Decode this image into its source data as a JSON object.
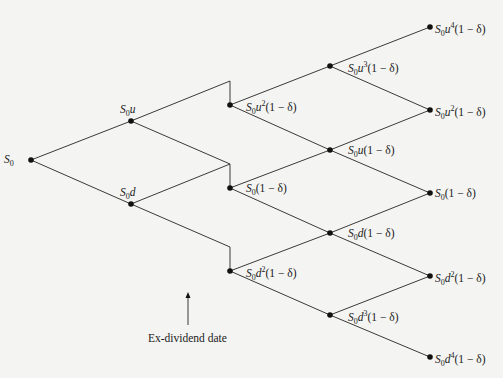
{
  "diagram": {
    "type": "binomial-tree",
    "colors": {
      "line": "#3a3a3a",
      "node": "#111111",
      "background": "#f4f4f2",
      "text": "#1a1a1a"
    },
    "nodes": [
      {
        "id": "n0",
        "x": 31,
        "y": 160,
        "label": "S0",
        "lx": 4,
        "ly": 154
      },
      {
        "id": "n1u",
        "x": 131,
        "y": 121,
        "label": "S0u",
        "lx": 120,
        "ly": 104
      },
      {
        "id": "n1d",
        "x": 131,
        "y": 204,
        "label": "S0d",
        "lx": 120,
        "ly": 187
      },
      {
        "id": "n2a",
        "x": 230,
        "y": 105,
        "label": "S0u²(1 − δ)",
        "lx": 246,
        "ly": 100
      },
      {
        "id": "n2b",
        "x": 230,
        "y": 188,
        "label": "S0(1 − δ)",
        "lx": 246,
        "ly": 183
      },
      {
        "id": "n2c",
        "x": 230,
        "y": 271,
        "label": "S0d²(1 − δ)",
        "lx": 246,
        "ly": 266
      },
      {
        "id": "n3a",
        "x": 330,
        "y": 66,
        "label": "S0u³(1 − δ)",
        "lx": 348,
        "ly": 61
      },
      {
        "id": "n3b",
        "x": 330,
        "y": 150,
        "label": "S0u(1 − δ)",
        "lx": 348,
        "ly": 145
      },
      {
        "id": "n3c",
        "x": 330,
        "y": 233,
        "label": "S0d(1 − δ)",
        "lx": 348,
        "ly": 228
      },
      {
        "id": "n3d",
        "x": 330,
        "y": 315,
        "label": "S0d³(1 − δ)",
        "lx": 348,
        "ly": 310
      },
      {
        "id": "n4a",
        "x": 430,
        "y": 27,
        "label": "S0u⁴(1 − δ)",
        "lx": 435,
        "ly": 22
      },
      {
        "id": "n4b",
        "x": 430,
        "y": 110,
        "label": "S0u²(1 − δ)",
        "lx": 435,
        "ly": 105
      },
      {
        "id": "n4c",
        "x": 430,
        "y": 193,
        "label": "S0(1 − δ)",
        "lx": 435,
        "ly": 188
      },
      {
        "id": "n4d",
        "x": 430,
        "y": 276,
        "label": "S0d²(1 − δ)",
        "lx": 435,
        "ly": 271
      },
      {
        "id": "n4e",
        "x": 430,
        "y": 357,
        "label": "S0d⁴(1 − δ)",
        "lx": 435,
        "ly": 352
      }
    ],
    "labels_rich": [
      {
        "node": "n0",
        "base": "S",
        "sub": "0",
        "rest": ""
      },
      {
        "node": "n1u",
        "base": "S",
        "sub": "0",
        "rest": "u"
      },
      {
        "node": "n1d",
        "base": "S",
        "sub": "0",
        "rest": "d"
      },
      {
        "node": "n2a",
        "base": "S",
        "sub": "0",
        "rest": "u",
        "sup": "2",
        "tail": "(1 − δ)"
      },
      {
        "node": "n2b",
        "base": "S",
        "sub": "0",
        "rest": "",
        "tail": "(1 − δ)"
      },
      {
        "node": "n2c",
        "base": "S",
        "sub": "0",
        "rest": "d",
        "sup": "2",
        "tail": "(1 − δ)"
      },
      {
        "node": "n3a",
        "base": "S",
        "sub": "0",
        "rest": "u",
        "sup": "3",
        "tail": "(1 − δ)"
      },
      {
        "node": "n3b",
        "base": "S",
        "sub": "0",
        "rest": "u",
        "tail": "(1 − δ)"
      },
      {
        "node": "n3c",
        "base": "S",
        "sub": "0",
        "rest": "d",
        "tail": "(1 − δ)"
      },
      {
        "node": "n3d",
        "base": "S",
        "sub": "0",
        "rest": "d",
        "sup": "3",
        "tail": "(1 − δ)"
      },
      {
        "node": "n4a",
        "base": "S",
        "sub": "0",
        "rest": "u",
        "sup": "4",
        "tail": "(1 − δ)"
      },
      {
        "node": "n4b",
        "base": "S",
        "sub": "0",
        "rest": "u",
        "sup": "2",
        "tail": "(1 − δ)"
      },
      {
        "node": "n4c",
        "base": "S",
        "sub": "0",
        "rest": "",
        "tail": "(1 − δ)"
      },
      {
        "node": "n4d",
        "base": "S",
        "sub": "0",
        "rest": "d",
        "sup": "2",
        "tail": "(1 − δ)"
      },
      {
        "node": "n4e",
        "base": "S",
        "sub": "0",
        "rest": "d",
        "sup": "4",
        "tail": "(1 − δ)"
      }
    ],
    "edges": [
      {
        "from": [
          31,
          160
        ],
        "to": [
          131,
          121
        ]
      },
      {
        "from": [
          31,
          160
        ],
        "to": [
          131,
          204
        ]
      },
      {
        "from": [
          131,
          121
        ],
        "to": [
          230,
          81
        ]
      },
      {
        "from": [
          131,
          121
        ],
        "to": [
          230,
          164
        ]
      },
      {
        "from": [
          131,
          204
        ],
        "to": [
          230,
          164
        ]
      },
      {
        "from": [
          131,
          204
        ],
        "to": [
          230,
          247
        ]
      },
      {
        "from": [
          230,
          81
        ],
        "to": [
          230,
          105
        ],
        "kind": "dividend-drop"
      },
      {
        "from": [
          230,
          164
        ],
        "to": [
          230,
          188
        ],
        "kind": "dividend-drop"
      },
      {
        "from": [
          230,
          247
        ],
        "to": [
          230,
          271
        ],
        "kind": "dividend-drop"
      },
      {
        "from": [
          230,
          105
        ],
        "to": [
          330,
          66
        ]
      },
      {
        "from": [
          230,
          105
        ],
        "to": [
          330,
          150
        ]
      },
      {
        "from": [
          230,
          188
        ],
        "to": [
          330,
          150
        ]
      },
      {
        "from": [
          230,
          188
        ],
        "to": [
          330,
          233
        ]
      },
      {
        "from": [
          230,
          271
        ],
        "to": [
          330,
          233
        ]
      },
      {
        "from": [
          230,
          271
        ],
        "to": [
          330,
          315
        ]
      },
      {
        "from": [
          330,
          66
        ],
        "to": [
          430,
          27
        ]
      },
      {
        "from": [
          330,
          66
        ],
        "to": [
          430,
          110
        ]
      },
      {
        "from": [
          330,
          150
        ],
        "to": [
          430,
          110
        ]
      },
      {
        "from": [
          330,
          150
        ],
        "to": [
          430,
          193
        ]
      },
      {
        "from": [
          330,
          233
        ],
        "to": [
          430,
          193
        ]
      },
      {
        "from": [
          330,
          233
        ],
        "to": [
          430,
          276
        ]
      },
      {
        "from": [
          330,
          315
        ],
        "to": [
          430,
          276
        ]
      },
      {
        "from": [
          330,
          315
        ],
        "to": [
          430,
          357
        ]
      }
    ],
    "annotation": {
      "text": "Ex-dividend date",
      "arrow": {
        "x": 188,
        "y_from": 325,
        "y_to": 292
      },
      "text_x": 148,
      "text_y": 332
    }
  }
}
